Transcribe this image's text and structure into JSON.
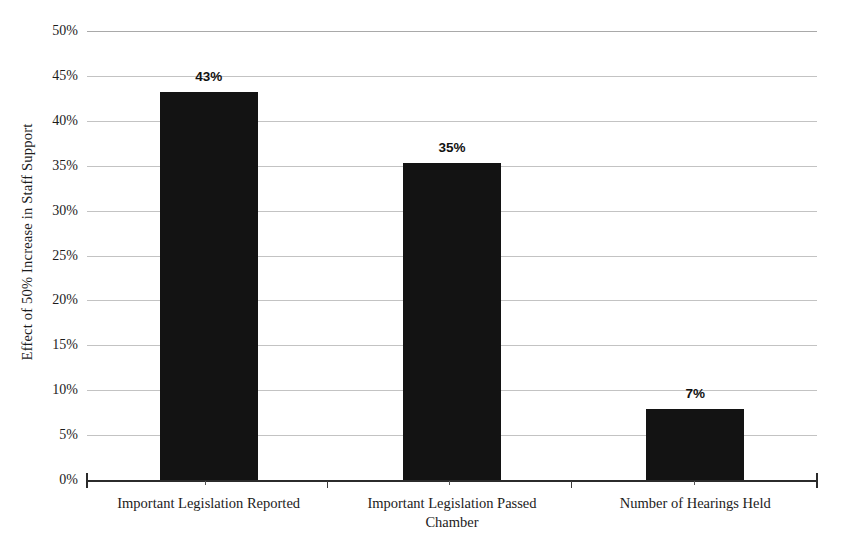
{
  "chart_data": {
    "type": "bar",
    "title": "",
    "xlabel": "",
    "ylabel": "Effect of 50% Increase in Staff Support",
    "categories": [
      "Important Legislation Reported",
      "Important Legislation Passed Chamber",
      "Number of Hearings Held"
    ],
    "values": [
      43,
      35,
      7
    ],
    "bar_tops_percent": [
      43.2,
      35.3,
      7.9
    ],
    "data_labels": [
      "43%",
      "35%",
      "7%"
    ],
    "ylim": [
      0,
      50
    ],
    "ytick_values": [
      50,
      45,
      40,
      35,
      30,
      25,
      20,
      15,
      10,
      5,
      0
    ],
    "ytick_labels": [
      "50%",
      "45%",
      "40%",
      "35%",
      "30%",
      "25%",
      "20%",
      "15%",
      "10%",
      "5%",
      "0%"
    ],
    "grid": true,
    "grid_axis": "y",
    "legend": "none",
    "bar_color": "#131313",
    "gridline_color": "#b8b8b8",
    "axis_color": "#2b2b2b",
    "background_color": "#ffffff"
  },
  "axis": {
    "y_title": "Effect of 50% Increase in Staff Support"
  },
  "categories_lines": [
    [
      "Important Legislation Reported"
    ],
    [
      "Important Legislation Passed",
      "Chamber"
    ],
    [
      "Number of Hearings Held"
    ]
  ]
}
